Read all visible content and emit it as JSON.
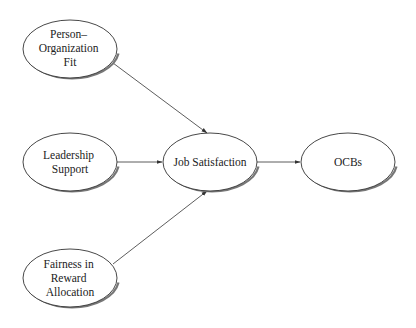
{
  "diagram": {
    "type": "path-model",
    "nodes": [
      {
        "id": "pof",
        "lines": [
          "Person–",
          "Organization",
          "Fit"
        ],
        "cx": 70,
        "cy": 49
      },
      {
        "id": "ls",
        "lines": [
          "Leadership",
          "Support"
        ],
        "cx": 70,
        "cy": 162
      },
      {
        "id": "fra",
        "lines": [
          "Fairness in",
          "Reward",
          "Allocation"
        ],
        "cx": 70,
        "cy": 278
      },
      {
        "id": "js",
        "lines": [
          "Job Satisfaction"
        ],
        "cx": 210,
        "cy": 162
      },
      {
        "id": "ocb",
        "lines": [
          "OCBs"
        ],
        "cx": 348,
        "cy": 162
      }
    ],
    "edges": [
      {
        "from": "pof",
        "to": "js"
      },
      {
        "from": "ls",
        "to": "js"
      },
      {
        "from": "fra",
        "to": "js"
      },
      {
        "from": "js",
        "to": "ocb"
      }
    ],
    "colors": {
      "stroke": "#333333",
      "shadow": "#777777",
      "background": "#ffffff",
      "text": "#222222"
    }
  }
}
